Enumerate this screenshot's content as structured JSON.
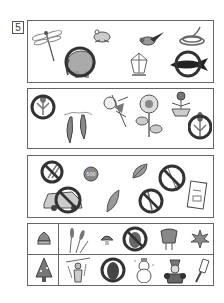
{
  "page": {
    "exercise_number": "5",
    "colors": {
      "ink": "#555555",
      "border": "#666666",
      "fill": "#aaaaaa",
      "dark": "#333333"
    }
  },
  "panels": [
    {
      "id": "animals",
      "items": [
        {
          "name": "dragonfly",
          "circled": false
        },
        {
          "name": "frog",
          "circled": false
        },
        {
          "name": "bird",
          "circled": false
        },
        {
          "name": "snake",
          "circled": false
        },
        {
          "name": "elephant",
          "circled": true
        },
        {
          "name": "crystal",
          "circled": false
        },
        {
          "name": "whale",
          "circled": true
        }
      ]
    },
    {
      "id": "plants",
      "items": [
        {
          "name": "tulip",
          "circled": true
        },
        {
          "name": "pea-pod",
          "circled": false
        },
        {
          "name": "morning-glory",
          "circled": false
        },
        {
          "name": "sunflower",
          "circled": false
        },
        {
          "name": "potted-flower",
          "circled": false
        },
        {
          "name": "tulip",
          "circled": true
        }
      ]
    },
    {
      "id": "objects",
      "items": [
        {
          "name": "paper-clip",
          "circled": true
        },
        {
          "name": "coin",
          "circled": false,
          "text": "500"
        },
        {
          "name": "leaf",
          "circled": false
        },
        {
          "name": "scissors",
          "circled": true
        },
        {
          "name": "car",
          "circled": true
        },
        {
          "name": "feather",
          "circled": false
        },
        {
          "name": "pencil",
          "circled": true
        },
        {
          "name": "booklet",
          "circled": false
        }
      ]
    },
    {
      "id": "seasons",
      "rows": [
        {
          "key": "chestnut",
          "items": [
            {
              "name": "pampas-grass",
              "circled": false
            },
            {
              "name": "mushroom",
              "circled": false
            },
            {
              "name": "beetle",
              "circled": true
            },
            {
              "name": "moon-viewing-dumplings",
              "circled": false
            },
            {
              "name": "maple-leaf",
              "circled": false
            }
          ]
        },
        {
          "key": "christmas-tree",
          "items": [
            {
              "name": "scarecrow",
              "circled": false
            },
            {
              "name": "owl",
              "circled": true
            },
            {
              "name": "snowman",
              "circled": false
            },
            {
              "name": "santa",
              "circled": false
            },
            {
              "name": "battledore",
              "circled": false
            }
          ]
        }
      ]
    }
  ]
}
